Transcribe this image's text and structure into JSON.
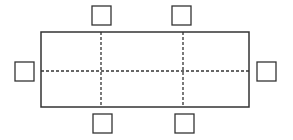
{
  "diagram": {
    "title": "",
    "stroke_color": "#333333",
    "table": {
      "x": 41,
      "y": 32,
      "width": 208,
      "height": 75
    },
    "dividers": {
      "vertical_x": [
        101,
        183
      ],
      "horizontal_y": [
        71
      ]
    },
    "chairs": [
      {
        "id": "top-left",
        "x": 92,
        "y": 6,
        "size": 19
      },
      {
        "id": "top-right",
        "x": 172,
        "y": 6,
        "size": 19
      },
      {
        "id": "left",
        "x": 15,
        "y": 62,
        "size": 19
      },
      {
        "id": "right",
        "x": 257,
        "y": 62,
        "size": 19
      },
      {
        "id": "bottom-left",
        "x": 93,
        "y": 114,
        "size": 19
      },
      {
        "id": "bottom-right",
        "x": 175,
        "y": 114,
        "size": 19
      }
    ]
  }
}
